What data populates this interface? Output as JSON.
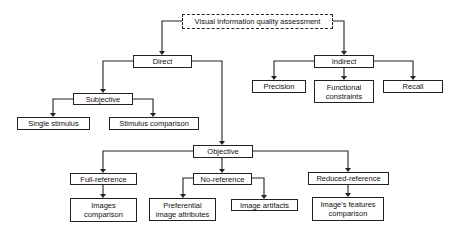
{
  "diagram": {
    "nodes": {
      "root": {
        "label": "Visual Information quality assessment"
      },
      "direct": {
        "label": "Direct"
      },
      "indirect": {
        "label": "Indirect"
      },
      "precision": {
        "label": "Precision"
      },
      "functional": {
        "label": "Functional constraints"
      },
      "recall": {
        "label": "Recall"
      },
      "subjective": {
        "label": "Subjective"
      },
      "single_stimulus": {
        "label": "Single stimulus"
      },
      "stimulus_comparison": {
        "label": "Stimulus comparison"
      },
      "objective": {
        "label": "Objective"
      },
      "full_reference": {
        "label": "Full-reference"
      },
      "no_reference": {
        "label": "No-reference"
      },
      "reduced_reference": {
        "label": "Reduced-reference"
      },
      "images_comparison": {
        "label": "Images comparison"
      },
      "preferential": {
        "label": "Preferential image attributes"
      },
      "image_artifacts": {
        "label": "Image artifacts"
      },
      "features_comparison": {
        "label": "Image's features comparison"
      }
    },
    "edges": [
      [
        "root",
        "direct"
      ],
      [
        "root",
        "indirect"
      ],
      [
        "indirect",
        "precision"
      ],
      [
        "indirect",
        "functional"
      ],
      [
        "indirect",
        "recall"
      ],
      [
        "direct",
        "subjective"
      ],
      [
        "direct",
        "objective"
      ],
      [
        "subjective",
        "single_stimulus"
      ],
      [
        "subjective",
        "stimulus_comparison"
      ],
      [
        "objective",
        "full_reference"
      ],
      [
        "objective",
        "no_reference"
      ],
      [
        "objective",
        "reduced_reference"
      ],
      [
        "full_reference",
        "images_comparison"
      ],
      [
        "no_reference",
        "preferential"
      ],
      [
        "no_reference",
        "image_artifacts"
      ],
      [
        "reduced_reference",
        "features_comparison"
      ]
    ],
    "colors": {
      "line": "#222222",
      "box_fill": "#ffffff",
      "text": "#111111"
    }
  }
}
